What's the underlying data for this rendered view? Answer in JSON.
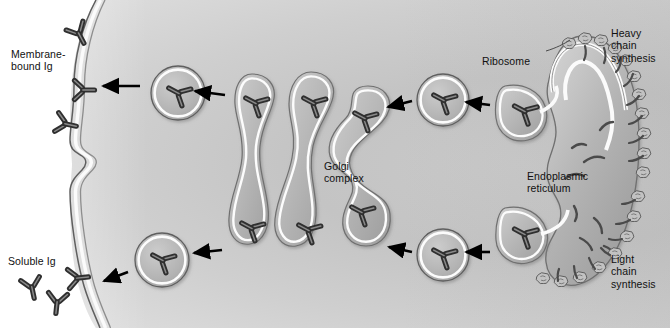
{
  "figure": {
    "type": "cell-biology-diagram",
    "palette": {
      "cytoplasm_light": "#e6e6e6",
      "cytoplasm_mid": "#c9c9c9",
      "organelle_fill": "#b0b0b0",
      "membrane_line": "#f4f4f4",
      "outline": "#6e6e6e",
      "antibody_dark": "#3a3a3a",
      "antibody_mid": "#6f6f6f",
      "arrow": "#000000",
      "label_text": "#111111",
      "background": "#ffffff"
    }
  },
  "labels": {
    "membrane_bound_ig": "Membrane-\nbound Ig",
    "soluble_ig": "Soluble Ig",
    "golgi_complex": "Golgi\ncomplex",
    "ribosome": "Ribosome",
    "endoplasmic_reticulum": "Endoplasmic\nreticulum",
    "heavy_chain_synthesis": "Heavy\nchain\nsynthesis",
    "light_chain_synthesis": "Light\nchain\nsynthesis"
  },
  "structures": {
    "cell_membrane": "cell-membrane",
    "cytoplasm": "cytoplasm",
    "rough_er": "rough-endoplasmic-reticulum",
    "golgi_cisternae_count": 3,
    "transport_vesicles_count": 4,
    "ribosome_clusters": "ribosomes-studding-outer-er-membrane",
    "nascent_chains": "nascent-polypeptide-chains-in-er-lumen"
  },
  "pathways": [
    {
      "name": "membrane-bound-ig-pathway",
      "row": "upper",
      "direction": "right-to-left",
      "steps": [
        "heavy-chain-synthesis",
        "endoplasmic-reticulum",
        "transport-vesicle",
        "golgi-complex",
        "transport-vesicle",
        "membrane-bound-ig"
      ]
    },
    {
      "name": "soluble-ig-pathway",
      "row": "lower",
      "direction": "right-to-left",
      "steps": [
        "light-chain-synthesis",
        "endoplasmic-reticulum",
        "transport-vesicle",
        "golgi-complex",
        "transport-vesicle",
        "soluble-ig"
      ]
    }
  ],
  "antibodies": {
    "shape": "Y-shaped immunoglobulin",
    "membrane_bound_count": 3,
    "soluble_free_count": 3,
    "in_vesicles": 4,
    "in_golgi": 6,
    "in_er_buds": 2
  }
}
